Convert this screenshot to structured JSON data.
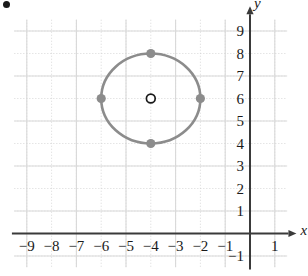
{
  "figure": {
    "kind": "coordinate-plane-circle-graph",
    "bullet_marker": "•",
    "axis_labels": {
      "x": "x",
      "y": "y"
    },
    "colors": {
      "axis": "#3a3a3a",
      "curve": "#8c8c8c",
      "point_fill": "#8c8c8c",
      "center_marker_stroke": "#1a1a1a",
      "grid_minor": "#c9c9c9",
      "grid_major": "#d9d9d9",
      "text": "#1a1a1a",
      "background": "#ffffff"
    }
  },
  "axes": {
    "x_ticks": [
      "−9",
      "−8",
      "−7",
      "−6",
      "−5",
      "−4",
      "−3",
      "−2",
      "−1",
      "1"
    ],
    "x_tick_values": [
      -9,
      -8,
      -7,
      -6,
      -5,
      -4,
      -3,
      -2,
      -1,
      1
    ],
    "y_ticks": [
      "9",
      "8",
      "7",
      "6",
      "5",
      "4",
      "3",
      "2",
      "1",
      "−1"
    ],
    "y_tick_values": [
      9,
      8,
      7,
      6,
      5,
      4,
      3,
      2,
      1,
      -1
    ],
    "xlim": [
      -9.6,
      1.9
    ],
    "ylim": [
      -1.6,
      9.6
    ],
    "grid": true,
    "grid_minor_step": 1,
    "grid_major_step": 2
  },
  "chart_data": {
    "type": "scatter",
    "title": "",
    "xlabel": "x",
    "ylabel": "y",
    "xlim": [
      -9.6,
      1.9
    ],
    "ylim": [
      -1.6,
      9.6
    ],
    "grid": true,
    "legend": null,
    "shapes": [
      {
        "name": "circle",
        "type": "circle",
        "center": [
          -4,
          6
        ],
        "radius": 2,
        "equation": "(x + 4)² + (y − 6)² = 4",
        "stroke": "#8c8c8c",
        "fill": "none",
        "stroke_width": 2.6
      }
    ],
    "points": [
      {
        "label": "top",
        "x": -4,
        "y": 8,
        "style": "filled",
        "color": "#8c8c8c"
      },
      {
        "label": "left",
        "x": -6,
        "y": 6,
        "style": "filled",
        "color": "#8c8c8c"
      },
      {
        "label": "right",
        "x": -2,
        "y": 6,
        "style": "filled",
        "color": "#8c8c8c"
      },
      {
        "label": "bottom",
        "x": -4,
        "y": 4,
        "style": "filled",
        "color": "#8c8c8c"
      },
      {
        "label": "center",
        "x": -4,
        "y": 6,
        "style": "open",
        "color": "#1a1a1a"
      }
    ]
  }
}
